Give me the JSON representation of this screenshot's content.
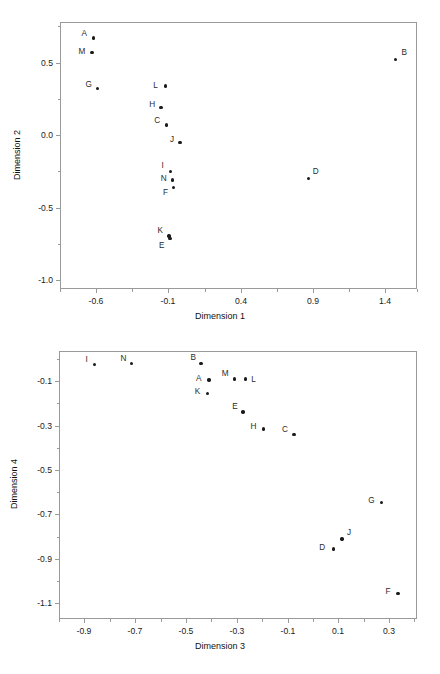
{
  "figure": {
    "faint_header": "",
    "background_color": "#ffffff",
    "point_color": "#1a1a1a",
    "frame_color": "#9a9a9a"
  },
  "chart_data": [
    {
      "type": "scatter",
      "title": "",
      "xlabel": "Dimension 1",
      "ylabel": "Dimension 2",
      "xlim": [
        -0.85,
        1.62
      ],
      "ylim": [
        -1.06,
        0.78
      ],
      "grid": false,
      "legend": "none",
      "xticks": [
        -0.6,
        -0.1,
        0.4,
        0.9,
        1.4
      ],
      "xticklabels": [
        "-0.6",
        "-0.1",
        "0.4",
        "0.9",
        "1.4"
      ],
      "xminorticks": [
        -0.85,
        -0.35,
        0.15,
        0.65,
        1.15,
        1.62
      ],
      "yticks": [
        0.5,
        0.0,
        -0.5,
        -1.0
      ],
      "yticklabels": [
        "0.5",
        "0.0",
        "-0.5",
        "-1.0"
      ],
      "yminorticks": [
        0.75,
        0.25,
        -0.25,
        -0.75
      ],
      "labels": [
        "A",
        "M",
        "B",
        "G",
        "L",
        "H",
        "C",
        "J",
        "I",
        "N",
        "F",
        "D",
        "K",
        "E"
      ],
      "x": [
        -0.62,
        -0.63,
        1.47,
        -0.59,
        -0.12,
        -0.15,
        -0.115,
        -0.02,
        -0.085,
        -0.07,
        -0.065,
        0.87,
        -0.095,
        -0.09
      ],
      "y": [
        0.67,
        0.57,
        0.52,
        0.32,
        0.34,
        0.19,
        0.07,
        -0.05,
        -0.25,
        -0.31,
        -0.36,
        -0.3,
        -0.695,
        -0.71
      ],
      "label_offsets": [
        {
          "dx": -9,
          "dy": -4
        },
        {
          "dx": -10,
          "dy": 0
        },
        {
          "dx": 9,
          "dy": -7
        },
        {
          "dx": -9,
          "dy": -4
        },
        {
          "dx": -10,
          "dy": 0
        },
        {
          "dx": -9,
          "dy": -3
        },
        {
          "dx": -9,
          "dy": -4
        },
        {
          "dx": -8,
          "dy": -2
        },
        {
          "dx": -8,
          "dy": -5
        },
        {
          "dx": -9,
          "dy": -1
        },
        {
          "dx": -8,
          "dy": 6
        },
        {
          "dx": 7,
          "dy": -7
        },
        {
          "dx": -9,
          "dy": -5
        },
        {
          "dx": -8,
          "dy": 8
        }
      ]
    },
    {
      "type": "scatter",
      "title": "",
      "xlabel": "Dimension 3",
      "ylabel": "Dimension 4",
      "xlim": [
        -1.0,
        0.41
      ],
      "ylim": [
        -1.17,
        0.035
      ],
      "grid": false,
      "legend": "none",
      "xticks": [
        -0.9,
        -0.7,
        -0.5,
        -0.3,
        -0.1,
        0.1,
        0.3
      ],
      "xticklabels": [
        "-0.9",
        "-0.7",
        "-0.5",
        "-0.3",
        "-0.1",
        "0.1",
        "0.3"
      ],
      "xminorticks": [
        -1.0,
        -0.8,
        -0.6,
        -0.4,
        -0.2,
        0.0,
        0.2,
        0.4
      ],
      "yticks": [
        -0.1,
        -0.3,
        -0.5,
        -0.7,
        -0.9,
        -1.1
      ],
      "yticklabels": [
        "-0.1",
        "-0.3",
        "-0.5",
        "-0.7",
        "-0.9",
        "-1.1"
      ],
      "yminorticks": [
        0.0,
        -0.2,
        -0.4,
        -0.6,
        -0.8,
        -1.0
      ],
      "labels": [
        "I",
        "N",
        "B",
        "A",
        "M",
        "L",
        "K",
        "E",
        "H",
        "C",
        "G",
        "J",
        "D",
        "F"
      ],
      "x": [
        -0.86,
        -0.715,
        -0.44,
        -0.41,
        -0.31,
        -0.265,
        -0.415,
        -0.275,
        -0.195,
        -0.075,
        0.27,
        0.115,
        0.08,
        0.335
      ],
      "y": [
        -0.025,
        -0.02,
        -0.02,
        -0.095,
        -0.09,
        -0.09,
        -0.155,
        -0.24,
        -0.315,
        -0.34,
        -0.645,
        -0.81,
        -0.855,
        -1.055
      ],
      "label_offsets": [
        {
          "dx": -8,
          "dy": -4
        },
        {
          "dx": -8,
          "dy": -4
        },
        {
          "dx": -8,
          "dy": -5
        },
        {
          "dx": -10,
          "dy": -1
        },
        {
          "dx": -9,
          "dy": -5
        },
        {
          "dx": 8,
          "dy": 1
        },
        {
          "dx": -10,
          "dy": -1
        },
        {
          "dx": -8,
          "dy": -5
        },
        {
          "dx": -10,
          "dy": -2
        },
        {
          "dx": -9,
          "dy": -4
        },
        {
          "dx": -10,
          "dy": -1
        },
        {
          "dx": 7,
          "dy": -6
        },
        {
          "dx": -11,
          "dy": -1
        },
        {
          "dx": -10,
          "dy": -1
        }
      ]
    }
  ]
}
